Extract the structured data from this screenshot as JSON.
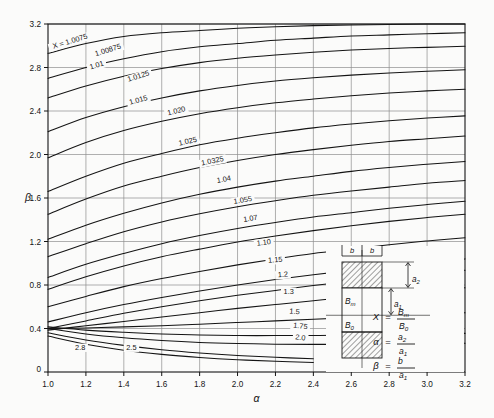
{
  "figure": {
    "background": "#fbfbfa",
    "ink": "#141414",
    "grid_color": "#8e8e8e",
    "plot_box": {
      "left": 48,
      "top": 24,
      "right": 465,
      "bottom": 372
    }
  },
  "chart_data": {
    "type": "line",
    "title": "",
    "xlabel": "α",
    "ylabel": "β",
    "xlim": [
      1.0,
      3.2
    ],
    "ylim": [
      0,
      3.2
    ],
    "xticks": [
      1.0,
      1.2,
      1.4,
      1.6,
      1.8,
      2.0,
      2.2,
      2.4,
      2.6,
      2.8,
      3.0,
      3.2
    ],
    "xticklabels": [
      "1.0",
      "1.2",
      "1.4",
      "1.6",
      "1.8",
      "2.0",
      "2.2",
      "2.4",
      "2.6",
      "2.8",
      "3.0",
      "3.2"
    ],
    "yticks": [
      0,
      0.4,
      0.8,
      1.2,
      1.6,
      2.0,
      2.4,
      2.8,
      3.2
    ],
    "yticklabels": [
      "0",
      "0.4",
      "0.8",
      "1.2",
      "1.6",
      "2.0",
      "2.4",
      "2.8",
      "3.2"
    ],
    "grid": true,
    "legend": "inline-curve-labels",
    "series_parameter": "X",
    "first_label_prefix": "X = ",
    "series": [
      {
        "name": "1.0075",
        "label": "X = 1.0075",
        "label_x": 1.12,
        "label_y": 3.02,
        "label_rot": -17,
        "x": [
          1.0,
          1.2,
          1.4,
          1.6,
          1.8,
          2.0,
          2.2,
          2.4,
          2.6,
          2.8,
          3.0,
          3.2
        ],
        "y": [
          2.93,
          3.02,
          3.085,
          3.12,
          3.14,
          3.16,
          3.175,
          3.185,
          3.19,
          3.195,
          3.2,
          3.2
        ]
      },
      {
        "name": "1.00875",
        "label": "1.00875",
        "label_x": 1.32,
        "label_y": 2.94,
        "label_rot": -17,
        "x": [
          1.0,
          1.2,
          1.4,
          1.6,
          1.8,
          2.0,
          2.2,
          2.4,
          2.6,
          2.8,
          3.0,
          3.2
        ],
        "y": [
          2.7,
          2.8,
          2.88,
          2.945,
          2.99,
          3.02,
          3.05,
          3.07,
          3.09,
          3.1,
          3.11,
          3.12
        ]
      },
      {
        "name": "1.01",
        "label": "1.01",
        "label_x": 1.26,
        "label_y": 2.8,
        "label_rot": -17,
        "x": [
          1.0,
          1.2,
          1.4,
          1.6,
          1.8,
          2.0,
          2.2,
          2.4,
          2.6,
          2.8,
          3.0,
          3.2
        ],
        "y": [
          2.52,
          2.63,
          2.72,
          2.79,
          2.845,
          2.885,
          2.915,
          2.94,
          2.96,
          2.975,
          2.985,
          2.995
        ]
      },
      {
        "name": "1.0125",
        "label": "1.0125",
        "label_x": 1.48,
        "label_y": 2.7,
        "label_rot": -17,
        "x": [
          1.0,
          1.2,
          1.4,
          1.6,
          1.8,
          2.0,
          2.2,
          2.4,
          2.6,
          2.8,
          3.0,
          3.2
        ],
        "y": [
          2.21,
          2.34,
          2.44,
          2.52,
          2.585,
          2.635,
          2.675,
          2.705,
          2.73,
          2.75,
          2.765,
          2.78
        ]
      },
      {
        "name": "1.015",
        "label": "1.015",
        "label_x": 1.48,
        "label_y": 2.48,
        "label_rot": -16,
        "x": [
          1.0,
          1.2,
          1.4,
          1.6,
          1.8,
          2.0,
          2.2,
          2.4,
          2.6,
          2.8,
          3.0,
          3.2
        ],
        "y": [
          1.97,
          2.11,
          2.22,
          2.305,
          2.375,
          2.43,
          2.475,
          2.51,
          2.54,
          2.565,
          2.585,
          2.6
        ]
      },
      {
        "name": "1.020",
        "label": "1.020",
        "label_x": 1.68,
        "label_y": 2.38,
        "label_rot": -14,
        "x": [
          1.0,
          1.2,
          1.4,
          1.6,
          1.8,
          2.0,
          2.2,
          2.4,
          2.6,
          2.8,
          3.0,
          3.2
        ],
        "y": [
          1.66,
          1.8,
          1.92,
          2.01,
          2.09,
          2.15,
          2.2,
          2.245,
          2.28,
          2.31,
          2.335,
          2.355
        ]
      },
      {
        "name": "1.025",
        "label": "1.025",
        "label_x": 1.74,
        "label_y": 2.1,
        "label_rot": -13,
        "x": [
          1.0,
          1.2,
          1.4,
          1.6,
          1.8,
          2.0,
          2.2,
          2.4,
          2.6,
          2.8,
          3.0,
          3.2
        ],
        "y": [
          1.45,
          1.59,
          1.71,
          1.8,
          1.88,
          1.945,
          2.0,
          2.045,
          2.085,
          2.12,
          2.145,
          2.17
        ]
      },
      {
        "name": "1.0325",
        "label": "1.0325",
        "label_x": 1.87,
        "label_y": 1.92,
        "label_rot": -12,
        "x": [
          1.0,
          1.2,
          1.4,
          1.6,
          1.8,
          2.0,
          2.2,
          2.4,
          2.6,
          2.8,
          3.0,
          3.2
        ],
        "y": [
          1.22,
          1.35,
          1.46,
          1.555,
          1.635,
          1.7,
          1.755,
          1.8,
          1.845,
          1.88,
          1.91,
          1.935
        ]
      },
      {
        "name": "1.04",
        "label": "1.04",
        "label_x": 1.93,
        "label_y": 1.75,
        "label_rot": -11,
        "x": [
          1.0,
          1.2,
          1.4,
          1.6,
          1.8,
          2.0,
          2.2,
          2.4,
          2.6,
          2.8,
          3.0,
          3.2
        ],
        "y": [
          1.06,
          1.18,
          1.29,
          1.38,
          1.455,
          1.52,
          1.575,
          1.625,
          1.665,
          1.7,
          1.735,
          1.76
        ]
      },
      {
        "name": "1.055",
        "label": "1.055",
        "label_x": 2.03,
        "label_y": 1.56,
        "label_rot": -10,
        "x": [
          1.0,
          1.2,
          1.4,
          1.6,
          1.8,
          2.0,
          2.2,
          2.4,
          2.6,
          2.8,
          3.0,
          3.2
        ],
        "y": [
          0.87,
          0.99,
          1.09,
          1.18,
          1.255,
          1.32,
          1.375,
          1.425,
          1.465,
          1.505,
          1.54,
          1.57
        ]
      },
      {
        "name": "1.07",
        "label": "1.07",
        "label_x": 2.07,
        "label_y": 1.39,
        "label_rot": -9,
        "x": [
          1.0,
          1.2,
          1.4,
          1.6,
          1.8,
          2.0,
          2.2,
          2.4,
          2.6,
          2.8,
          3.0,
          3.2
        ],
        "y": [
          0.76,
          0.875,
          0.975,
          1.06,
          1.13,
          1.195,
          1.25,
          1.3,
          1.345,
          1.385,
          1.42,
          1.45
        ]
      },
      {
        "name": "1.10",
        "label": "1.10",
        "label_x": 2.14,
        "label_y": 1.17,
        "label_rot": -7,
        "x": [
          1.0,
          1.2,
          1.4,
          1.6,
          1.8,
          2.0,
          2.2,
          2.4,
          2.6,
          2.8,
          3.0,
          3.2
        ],
        "y": [
          0.6,
          0.695,
          0.785,
          0.86,
          0.925,
          0.985,
          1.04,
          1.09,
          1.13,
          1.17,
          1.205,
          1.235
        ]
      },
      {
        "name": "1.15",
        "label": "1.15",
        "label_x": 2.2,
        "label_y": 1.01,
        "label_rot": -5,
        "x": [
          1.0,
          1.2,
          1.4,
          1.6,
          1.8,
          2.0,
          2.2,
          2.4,
          2.6,
          2.8,
          3.0,
          3.2
        ],
        "y": [
          0.46,
          0.545,
          0.62,
          0.685,
          0.745,
          0.8,
          0.85,
          0.895,
          0.935,
          0.975,
          1.01,
          1.04
        ]
      },
      {
        "name": "1.2",
        "label": "1.2",
        "label_x": 2.24,
        "label_y": 0.875,
        "label_rot": -4,
        "x": [
          1.0,
          1.2,
          1.4,
          1.6,
          1.8,
          2.0,
          2.2,
          2.4,
          2.6,
          2.8,
          3.0,
          3.2
        ],
        "y": [
          0.4,
          0.47,
          0.54,
          0.6,
          0.655,
          0.705,
          0.75,
          0.795,
          0.835,
          0.87,
          0.905,
          0.935
        ]
      },
      {
        "name": "1.3",
        "label": "1.3",
        "label_x": 2.27,
        "label_y": 0.72,
        "label_rot": 0,
        "x": [
          1.0,
          1.2,
          1.4,
          1.6,
          1.8,
          2.0,
          2.2,
          2.4,
          2.6,
          2.8,
          3.0,
          3.2
        ],
        "y": [
          0.385,
          0.425,
          0.465,
          0.505,
          0.545,
          0.585,
          0.62,
          0.655,
          0.69,
          0.72,
          0.75,
          0.775
        ]
      },
      {
        "name": "1.5",
        "label": "1.5",
        "label_x": 2.3,
        "label_y": 0.535,
        "label_rot": 4,
        "x": [
          1.0,
          1.2,
          1.4,
          1.6,
          1.8,
          2.0,
          2.2,
          2.4,
          2.6,
          2.8,
          3.0,
          3.2
        ],
        "y": [
          0.4,
          0.405,
          0.415,
          0.425,
          0.44,
          0.455,
          0.47,
          0.485,
          0.5,
          0.515,
          0.53,
          0.545
        ]
      },
      {
        "name": "1.75",
        "label": "1.75",
        "label_x": 2.33,
        "label_y": 0.4,
        "label_rot": 7,
        "x": [
          1.0,
          1.2,
          1.4,
          1.6,
          1.8,
          2.0,
          2.2,
          2.4,
          2.6,
          2.8,
          3.0,
          3.2
        ],
        "y": [
          0.415,
          0.385,
          0.365,
          0.35,
          0.34,
          0.335,
          0.335,
          0.335,
          0.34,
          0.345,
          0.35,
          0.355
        ]
      },
      {
        "name": "2.0",
        "label": "2.0",
        "label_x": 2.33,
        "label_y": 0.295,
        "label_rot": 8,
        "x": [
          1.0,
          1.2,
          1.4,
          1.6,
          1.8,
          2.0,
          2.2,
          2.4,
          2.6,
          2.8,
          3.0,
          3.2
        ],
        "y": [
          0.4,
          0.35,
          0.315,
          0.29,
          0.272,
          0.262,
          0.256,
          0.254,
          0.254,
          0.256,
          0.26,
          0.265
        ]
      },
      {
        "name": "2.5",
        "label": "2.5",
        "label_x": 1.44,
        "label_y": 0.205,
        "label_rot": 0,
        "x": [
          1.0,
          1.2,
          1.4,
          1.6,
          1.8,
          2.0,
          2.2,
          2.4
        ],
        "y": [
          0.36,
          0.295,
          0.245,
          0.205,
          0.175,
          0.152,
          0.135,
          0.122
        ]
      },
      {
        "name": "2.8",
        "label": "2.8",
        "label_x": 1.17,
        "label_y": 0.205,
        "label_rot": 0,
        "x": [
          1.0,
          1.2,
          1.4,
          1.6,
          1.8,
          2.0,
          2.2,
          2.4
        ],
        "y": [
          0.33,
          0.255,
          0.2,
          0.162,
          0.134,
          0.113,
          0.098,
          0.087
        ]
      }
    ]
  },
  "inset": {
    "name": "core-cross-section-diagram",
    "dim_b_left": "b",
    "dim_b_right": "b",
    "field_bm": "B",
    "field_bm_sub": "m",
    "field_b0": "B",
    "field_b0_sub": "0",
    "dim_a1": "a",
    "dim_a1_sub": "1",
    "dim_a2": "a",
    "dim_a2_sub": "2",
    "formulas": [
      {
        "lhs": "X",
        "eq": "=",
        "num": "B",
        "num_sub": "m",
        "den": "B",
        "den_sub": "0"
      },
      {
        "lhs": "α",
        "eq": "=",
        "num": "a",
        "num_sub": "2",
        "den": "a",
        "den_sub": "1"
      },
      {
        "lhs": "β",
        "eq": "=",
        "num": "b",
        "num_sub": "",
        "den": "a",
        "den_sub": "1"
      }
    ]
  }
}
